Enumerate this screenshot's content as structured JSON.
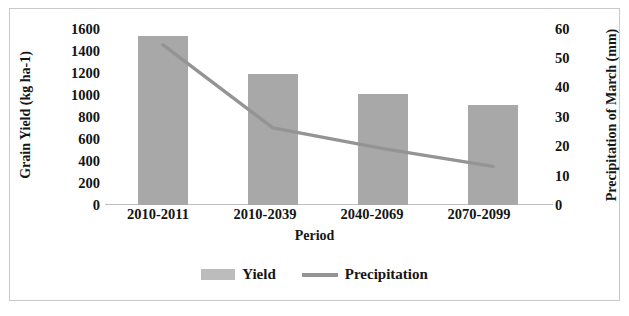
{
  "chart_data": {
    "type": "bar",
    "title": "",
    "xlabel": "Period",
    "categories": [
      "2010-2011",
      "2010-2039",
      "2040-2069",
      "2070-2099"
    ],
    "grid": false,
    "legend_position": "bottom",
    "series": [
      {
        "name": "Yield",
        "type": "bar",
        "axis": "left",
        "ylabel": "Grain Yield (kg ha-1)",
        "ylim": [
          0,
          1600
        ],
        "ytick_step": 200,
        "yticks": [
          "1600",
          "1400",
          "1200",
          "1000",
          "800",
          "600",
          "400",
          "200",
          "0"
        ],
        "color": "#a8a8a8",
        "values": [
          1520,
          1180,
          1000,
          900
        ]
      },
      {
        "name": "Precipitation",
        "type": "line",
        "axis": "right",
        "ylabel": "Precipitation of March (mm)",
        "ylim": [
          0,
          60
        ],
        "ytick_step": 10,
        "yticks": [
          "60",
          "50",
          "40",
          "30",
          "20",
          "10",
          "0"
        ],
        "color": "#949494",
        "values": [
          54,
          26,
          19,
          13
        ]
      }
    ]
  },
  "axes": {
    "left_title": "Grain Yield (kg ha-1)",
    "right_title": "Precipitation of March (mm)",
    "x_title": "Period",
    "left_ticks": [
      "1600",
      "1400",
      "1200",
      "1000",
      "800",
      "600",
      "400",
      "200",
      "0"
    ],
    "right_ticks": [
      "60",
      "50",
      "40",
      "30",
      "20",
      "10",
      "0"
    ],
    "categories": [
      "2010-2011",
      "2010-2039",
      "2040-2069",
      "2070-2099"
    ]
  },
  "legend": {
    "items": [
      {
        "label": "Yield",
        "marker": "bar-swatch",
        "color": "#bcbcbc"
      },
      {
        "label": "Precipitation",
        "marker": "line-swatch",
        "color": "#949494"
      }
    ]
  },
  "colors": {
    "bar": "#a8a8a8",
    "line": "#949494",
    "axis": "#bdbdbd",
    "frame": "#c9c9c9",
    "text": "#141414",
    "background": "#ffffff"
  }
}
